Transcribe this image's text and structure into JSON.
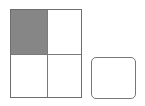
{
  "diagram": {
    "type": "fraction-grid",
    "rows": 2,
    "cols": 2,
    "shaded_cells": [
      [
        0,
        0
      ]
    ],
    "shade_color": "#868686",
    "line_color": "#6e6e6e",
    "answer_box": {
      "label": ""
    }
  }
}
